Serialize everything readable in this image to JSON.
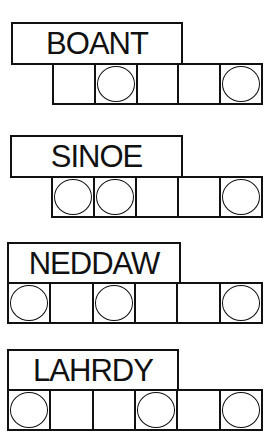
{
  "puzzles": [
    {
      "scrambled_word": "BOANT",
      "letter_count": 5,
      "circled_positions": [
        2,
        5
      ],
      "cells": [
        {
          "circled": false
        },
        {
          "circled": true
        },
        {
          "circled": false
        },
        {
          "circled": false
        },
        {
          "circled": true
        }
      ]
    },
    {
      "scrambled_word": "SINOE",
      "letter_count": 5,
      "circled_positions": [
        1,
        2,
        5
      ],
      "cells": [
        {
          "circled": true
        },
        {
          "circled": true
        },
        {
          "circled": false
        },
        {
          "circled": false
        },
        {
          "circled": true
        }
      ]
    },
    {
      "scrambled_word": "NEDDAW",
      "letter_count": 6,
      "circled_positions": [
        1,
        3,
        6
      ],
      "cells": [
        {
          "circled": true
        },
        {
          "circled": false
        },
        {
          "circled": true
        },
        {
          "circled": false
        },
        {
          "circled": false
        },
        {
          "circled": true
        }
      ]
    },
    {
      "scrambled_word": "LAHRDY",
      "letter_count": 6,
      "circled_positions": [
        1,
        4,
        6
      ],
      "cells": [
        {
          "circled": true
        },
        {
          "circled": false
        },
        {
          "circled": false
        },
        {
          "circled": true
        },
        {
          "circled": false
        },
        {
          "circled": true
        }
      ]
    }
  ],
  "colors": {
    "ink": "#111111",
    "paper": "#ffffff"
  }
}
